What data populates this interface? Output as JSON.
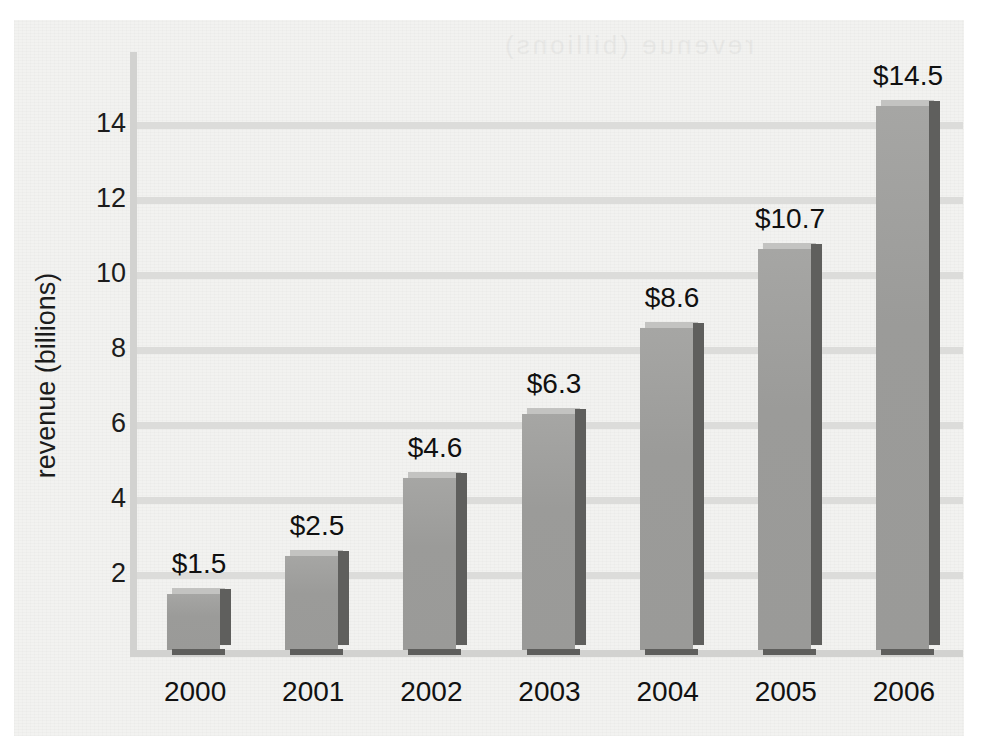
{
  "figure": {
    "background_color": "#f2f2f0",
    "page_color": "#ffffff"
  },
  "colors": {
    "bar_front": "#9a9a98",
    "bar_top": "#c3c3c1",
    "bar_side": "#5f5f5d",
    "gridline": "#dcdcda",
    "axis_line": "#d2d2d0",
    "text": "#111111"
  },
  "chart_data": {
    "type": "bar",
    "title": "",
    "xlabel": "",
    "ylabel": "revenue (billions)",
    "categories": [
      "2000",
      "2001",
      "2002",
      "2003",
      "2004",
      "2005",
      "2006"
    ],
    "values": [
      1.5,
      2.5,
      4.6,
      6.3,
      8.6,
      10.7,
      14.5
    ],
    "value_labels": [
      "$1.5",
      "$2.5",
      "$4.6",
      "$6.3",
      "$8.6",
      "$10.7",
      "$14.5"
    ],
    "ytick_labels": [
      "2",
      "4",
      "6",
      "8",
      "10",
      "12",
      "14"
    ],
    "yticks": [
      2,
      4,
      6,
      8,
      10,
      12,
      14
    ],
    "ylim": [
      0,
      15.5
    ],
    "grid": true,
    "grid_axis": "y",
    "legend": false,
    "legend_position": "none",
    "bar_style": "3d",
    "currency_prefix": "$",
    "units": "billions"
  },
  "axis": {
    "y_title": "revenue (billions)"
  },
  "showthrough_text": "revenue (billions)"
}
